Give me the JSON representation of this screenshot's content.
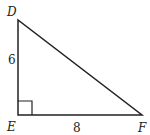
{
  "diagram": {
    "type": "right-triangle",
    "vertices": {
      "D": {
        "label": "D",
        "x": 18,
        "y": 20
      },
      "E": {
        "label": "E",
        "x": 18,
        "y": 115
      },
      "F": {
        "label": "F",
        "x": 142,
        "y": 115
      }
    },
    "right_angle_at": "E",
    "sides": {
      "DE": {
        "label": "6"
      },
      "EF": {
        "label": "8"
      }
    },
    "colors": {
      "stroke": "#222222",
      "background": "#ffffff"
    }
  }
}
